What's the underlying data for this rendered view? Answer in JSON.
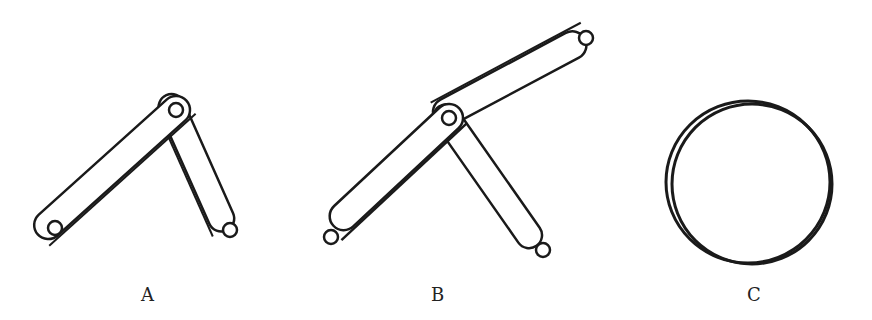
{
  "figure": {
    "panels": [
      {
        "id": "A",
        "label": "A",
        "description": "Two links pinned at top forming an inverted V"
      },
      {
        "id": "B",
        "label": "B",
        "description": "Three links joined at one pivot"
      },
      {
        "id": "C",
        "label": "C",
        "description": "Disc / circle viewed edge-on"
      }
    ],
    "stroke_color": "#1a1a1a",
    "background": "#ffffff"
  }
}
